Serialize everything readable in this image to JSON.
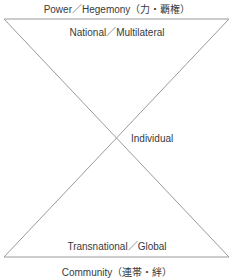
{
  "diagram": {
    "top_label": "Power／Hegemony（力・覇権）",
    "upper_label": "National／Multilateral",
    "center_label": "Individual",
    "lower_label": "Transnational／Global",
    "bottom_label": "Community（連帯・絆）",
    "line_color": "#9a9a9a",
    "shape": "hourglass (two triangles meeting at a point)"
  }
}
